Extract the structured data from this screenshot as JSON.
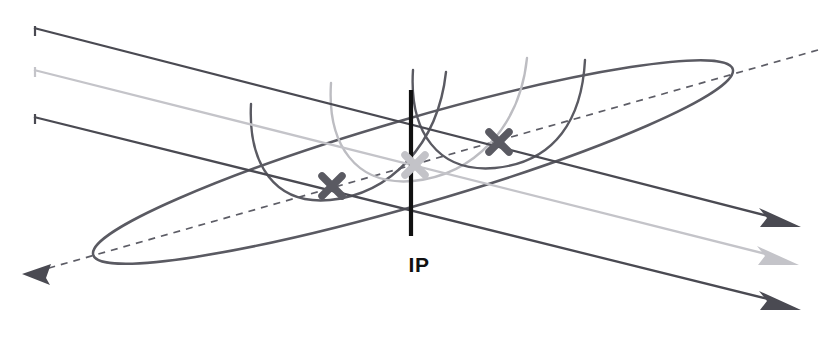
{
  "figure": {
    "background_color": "#ffffff",
    "width": 830,
    "height": 339
  },
  "labels": {
    "ip": "IP",
    "ip_position": {
      "x": 419,
      "y": 272
    }
  },
  "colors": {
    "dark": "#4a4a52",
    "dark_stroke": "#555560",
    "mid_gray": "#9a9aa0",
    "light_gray": "#c8c8cc",
    "ip_line": "#111111",
    "marker_dark": "#5a5a62",
    "marker_light": "#bfbfc4",
    "dashed": "#5d5d66"
  },
  "elements": {
    "ip_vertical_line": {
      "name": "IP vertical axis",
      "x": 411,
      "y_top": 90,
      "y_bottom": 236,
      "color": "#111111",
      "width": 4
    },
    "beam_lines": [
      {
        "id": "beam-top-dark",
        "color": "#4a4a52",
        "start": {
          "x": 35,
          "y": 29
        },
        "end": {
          "x": 786,
          "y": 221
        },
        "has_start_tick": true,
        "has_arrowhead": true,
        "arrow_color": "#4a4a52"
      },
      {
        "id": "beam-mid-light",
        "color": "#c4c4c9",
        "start": {
          "x": 35,
          "y": 70
        },
        "end": {
          "x": 784,
          "y": 259
        },
        "has_start_tick": true,
        "has_arrowhead": true,
        "arrow_color": "#c4c4c9"
      },
      {
        "id": "beam-bottom-dark",
        "color": "#4a4a52",
        "start": {
          "x": 35,
          "y": 117
        },
        "end": {
          "x": 786,
          "y": 304
        },
        "has_start_tick": true,
        "has_arrowhead": true,
        "arrow_color": "#4a4a52"
      }
    ],
    "dashed_axis": {
      "id": "dashed-crossing-axis",
      "color": "#5d5d66",
      "start": {
        "x": 818,
        "y": 50
      },
      "end": {
        "x": 33,
        "y": 273
      },
      "dash_pattern": "7,6",
      "arrowhead_at": "end",
      "arrow_color": "#4a4a52"
    },
    "ellipse": {
      "id": "bunch-ellipse",
      "color": "#5a5a62",
      "center": {
        "x": 413,
        "y": 162
      },
      "rx": 332,
      "ry": 42,
      "rotation_deg": -16.0,
      "fill": "none",
      "stroke_width": 2.4
    },
    "arcs": [
      {
        "id": "arc-dark-left",
        "color": "#5a5a62",
        "stroke_width": 2.4,
        "description": "dark U-shaped parabola, left"
      },
      {
        "id": "arc-light-right",
        "color": "#b6b6bb",
        "stroke_width": 2.4,
        "description": "light gray U-shaped parabola, right"
      }
    ],
    "crossing_markers": [
      {
        "id": "x-marker-left",
        "x": 332,
        "y": 186,
        "color": "#5a5a62",
        "size": 15,
        "tone": "dark"
      },
      {
        "id": "x-marker-center",
        "x": 415,
        "y": 165,
        "color": "#c3c3c8",
        "size": 15,
        "tone": "light"
      },
      {
        "id": "x-marker-right",
        "x": 499,
        "y": 142,
        "color": "#5a5a62",
        "size": 15,
        "tone": "dark"
      }
    ]
  }
}
